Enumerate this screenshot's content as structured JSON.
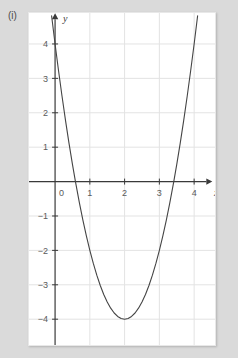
{
  "figure": {
    "label": "(i)",
    "background_color": "#dadada",
    "panel_color": "#ffffff"
  },
  "chart_data": {
    "type": "line",
    "title": "",
    "subtitle": "",
    "xlabel": "x",
    "ylabel": "y",
    "xlim": [
      -0.75,
      4.6
    ],
    "ylim": [
      -4.75,
      4.9
    ],
    "xticks": [
      0,
      1,
      2,
      3,
      4
    ],
    "xtick_labels": [
      "0",
      "1",
      "2",
      "3",
      "4"
    ],
    "yticks": [
      -4,
      -3,
      -2,
      -1,
      1,
      2,
      3,
      4
    ],
    "ytick_labels": [
      "−4",
      "−3",
      "−2",
      "−1",
      "1",
      "2",
      "3",
      "4"
    ],
    "grid": true,
    "grid_color": "#e3e3e3",
    "axis_color": "#3a3a3a",
    "legend": null,
    "series": [
      {
        "name": "parabola",
        "equation": "y = 2(x - 2)^2 - 4",
        "color": "#444444",
        "line_width": 1.1,
        "vertex": [
          2,
          -4
        ],
        "y_intercept": 4,
        "roots": [
          0.586,
          3.414
        ],
        "x": [
          -0.1,
          0.0,
          0.1,
          0.2,
          0.3,
          0.4,
          0.5,
          0.586,
          0.7,
          0.8,
          0.9,
          1.0,
          1.1,
          1.2,
          1.3,
          1.4,
          1.5,
          1.6,
          1.7,
          1.8,
          1.9,
          2.0,
          2.1,
          2.2,
          2.3,
          2.4,
          2.5,
          2.6,
          2.7,
          2.8,
          2.9,
          3.0,
          3.1,
          3.2,
          3.3,
          3.414,
          3.5,
          3.6,
          3.7,
          3.8,
          3.9,
          4.0,
          4.1
        ],
        "y": [
          4.82,
          4.0,
          3.22,
          2.48,
          1.78,
          1.12,
          0.5,
          0.0,
          -0.62,
          -1.12,
          -1.58,
          -2.0,
          -2.38,
          -2.72,
          -3.02,
          -3.28,
          -3.5,
          -3.68,
          -3.82,
          -3.92,
          -3.98,
          -4.0,
          -3.98,
          -3.92,
          -3.82,
          -3.68,
          -3.5,
          -3.28,
          -3.02,
          -2.72,
          -2.38,
          -2.0,
          -1.58,
          -1.12,
          -0.62,
          0.0,
          0.5,
          1.12,
          1.78,
          2.48,
          3.22,
          4.0,
          4.82
        ]
      }
    ]
  }
}
